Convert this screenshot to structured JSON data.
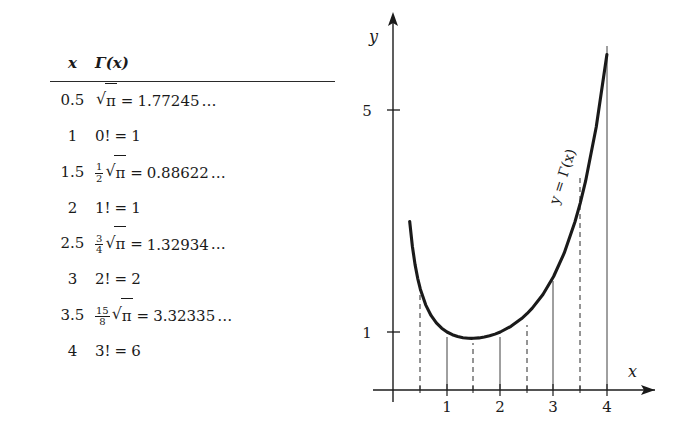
{
  "figure": {
    "kind": "gamma-function-table-and-plot"
  },
  "table": {
    "headers": {
      "x": "x",
      "gamma": "Γ(x)"
    },
    "rows": [
      {
        "x": "0.5",
        "coef_num": "",
        "coef_den": "",
        "has_sqrt": true,
        "radicand": "π",
        "factorial": "",
        "eq": "=",
        "value": "1.77245",
        "dots": "…"
      },
      {
        "x": "1",
        "coef_num": "",
        "coef_den": "",
        "has_sqrt": false,
        "radicand": "",
        "factorial": "0!",
        "eq": "=",
        "value": "1",
        "dots": ""
      },
      {
        "x": "1.5",
        "coef_num": "1",
        "coef_den": "2",
        "has_sqrt": true,
        "radicand": "π",
        "factorial": "",
        "eq": "=",
        "value": "0.88622",
        "dots": "…"
      },
      {
        "x": "2",
        "coef_num": "",
        "coef_den": "",
        "has_sqrt": false,
        "radicand": "",
        "factorial": "1!",
        "eq": "=",
        "value": "1",
        "dots": ""
      },
      {
        "x": "2.5",
        "coef_num": "3",
        "coef_den": "4",
        "has_sqrt": true,
        "radicand": "π",
        "factorial": "",
        "eq": "=",
        "value": "1.32934",
        "dots": "…"
      },
      {
        "x": "3",
        "coef_num": "",
        "coef_den": "",
        "has_sqrt": false,
        "radicand": "",
        "factorial": "2!",
        "eq": "=",
        "value": "2",
        "dots": ""
      },
      {
        "x": "3.5",
        "coef_num": "15",
        "coef_den": "8",
        "has_sqrt": true,
        "radicand": "π",
        "factorial": "",
        "eq": "=",
        "value": "3.32335",
        "dots": "…"
      },
      {
        "x": "4",
        "coef_num": "",
        "coef_den": "",
        "has_sqrt": false,
        "radicand": "",
        "factorial": "3!",
        "eq": "=",
        "value": "6",
        "dots": ""
      }
    ]
  },
  "chart_data": {
    "type": "line",
    "title": "",
    "xlabel": "x",
    "ylabel": "y",
    "curve_label": "y = Γ(x)",
    "xlim": [
      -0.2,
      4.6
    ],
    "ylim": [
      0,
      7.6
    ],
    "grid": false,
    "legend": "none",
    "x_ticks": [
      "1",
      "2",
      "3",
      "4"
    ],
    "x_tick_values": [
      1,
      2,
      3,
      4
    ],
    "y_ticks": [
      "1",
      "5"
    ],
    "y_tick_values": [
      1,
      5
    ],
    "solid_droplines_at": [
      1,
      2,
      3,
      4
    ],
    "dashed_droplines_at": [
      0.5,
      1.5,
      2.5,
      3.5
    ],
    "x": [
      0.3,
      0.35,
      0.4,
      0.45,
      0.5,
      0.6,
      0.7,
      0.8,
      0.9,
      1.0,
      1.1,
      1.2,
      1.3,
      1.4,
      1.46,
      1.5,
      1.6,
      1.7,
      1.8,
      1.9,
      2.0,
      2.2,
      2.4,
      2.5,
      2.6,
      2.8,
      3.0,
      3.2,
      3.4,
      3.5,
      3.6,
      3.8,
      4.0,
      4.1
    ],
    "values": [
      2.9916,
      2.5461,
      2.2182,
      1.9681,
      1.7725,
      1.4892,
      1.2981,
      1.1642,
      1.0686,
      1.0,
      0.9514,
      0.9182,
      0.8975,
      0.8873,
      0.8856,
      0.8862,
      0.8935,
      0.9086,
      0.9314,
      0.9618,
      1.0,
      1.1018,
      1.2422,
      1.3293,
      1.4296,
      1.6765,
      2.0,
      2.424,
      2.9812,
      3.3234,
      3.717,
      4.6942,
      6.0,
      6.8126
    ],
    "color": "#1a1a1a"
  },
  "axis": {
    "x_arrow": true,
    "y_arrow": true
  }
}
